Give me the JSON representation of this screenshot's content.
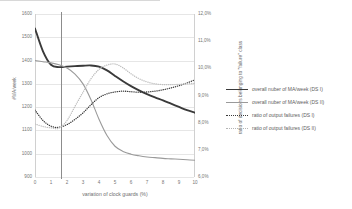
{
  "chart_data": {
    "type": "line",
    "title": "",
    "xlabel": "variation of clock guards (%)",
    "ylabel": "#MA/week",
    "ylabel_right": "ratio of decisions belonging to \"failure\" class",
    "xlim": [
      0,
      10
    ],
    "ylim": [
      900,
      1600
    ],
    "ylim_right": [
      6.0,
      12.0
    ],
    "grid": true,
    "legend_position": "right",
    "xticks": [
      "0",
      "1",
      "2",
      "3",
      "4",
      "5",
      "6",
      "7",
      "8",
      "9",
      "10"
    ],
    "yticks_left": [
      "1600",
      "1500",
      "1400",
      "1300",
      "1200",
      "1100",
      "1000",
      "900"
    ],
    "yticks_right": [
      "12,0%",
      "11,0%",
      "10,0%",
      "9,0%",
      "8,0%",
      "7,0%",
      "6,0%"
    ],
    "annotations": [
      {
        "name": "reference-line",
        "type": "vline",
        "x": 1.6
      }
    ],
    "x": [
      0,
      0.5,
      1,
      1.5,
      2,
      2.5,
      3,
      3.5,
      4,
      4.5,
      5,
      5.5,
      6,
      6.5,
      7,
      7.5,
      8,
      8.5,
      9,
      9.5,
      10
    ],
    "series": [
      {
        "name": "overall nuber of MA/week (DS I)",
        "axis": "left",
        "style": "solid-thick",
        "color": "#3a3a3a",
        "values": [
          1538,
          1440,
          1382,
          1372,
          1374,
          1376,
          1378,
          1379,
          1374,
          1358,
          1334,
          1311,
          1290,
          1272,
          1256,
          1242,
          1229,
          1215,
          1201,
          1187,
          1176
        ]
      },
      {
        "name": "overall nuber of MA/week (DS II)",
        "axis": "left",
        "style": "solid-thin",
        "color": "#9a9a9a",
        "values": [
          1400,
          1395,
          1390,
          1382,
          1368,
          1342,
          1300,
          1232,
          1148,
          1078,
          1032,
          1010,
          998,
          991,
          986,
          983,
          980,
          978,
          976,
          974,
          972
        ]
      },
      {
        "name": "ratio of output failures (DS I)",
        "axis": "right",
        "style": "dotted-dark",
        "color": "#3a3a3a",
        "values": [
          8.46,
          8.08,
          7.87,
          7.83,
          7.93,
          8.12,
          8.36,
          8.66,
          8.92,
          9.06,
          9.13,
          9.16,
          9.14,
          9.12,
          9.13,
          9.16,
          9.21,
          9.28,
          9.36,
          9.46,
          9.58
        ]
      },
      {
        "name": "ratio of output failures (DS II)",
        "axis": "right",
        "style": "dotted-light",
        "color": "#b4b4b4",
        "values": [
          7.95,
          7.86,
          7.81,
          7.8,
          8.08,
          8.6,
          9.12,
          9.62,
          9.96,
          10.12,
          10.16,
          10.02,
          9.8,
          9.62,
          9.5,
          9.43,
          9.4,
          9.4,
          9.41,
          9.43,
          9.45
        ]
      }
    ]
  },
  "legend": {
    "items": [
      {
        "label": "overall nuber of MA/week (DS I)"
      },
      {
        "label": "overall nuber of MA/week (DS II)"
      },
      {
        "label": "ratio of output failures (DS I)"
      },
      {
        "label": "ratio of output failures (DS II)"
      }
    ]
  }
}
